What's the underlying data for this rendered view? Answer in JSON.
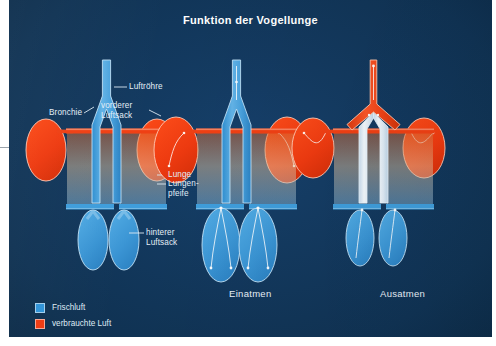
{
  "poster": {
    "title": "Funktion der Vogellunge",
    "background_color": "#12395f",
    "fresh_air_color": "#2f93d8",
    "used_air_color": "#f03a10",
    "lung_tube_top_color": "#ef3c12",
    "lung_tube_mid_color": "#f6dcc2",
    "lung_tube_bottom_color": "#3a9ada",
    "label_color": "#e3eef7"
  },
  "labels": {
    "trachea": "Luftröhre",
    "bronchus": "Bronchie",
    "front_air_sac": "vorderer\nLuftsack",
    "lung": "Lunge",
    "lung_pipe": "Lungen-\npfeife",
    "rear_air_sac": "hinterer\nLuftsack"
  },
  "panels": [
    {
      "id": "anatomy",
      "caption": ""
    },
    {
      "id": "inhale",
      "caption": "Einatmen"
    },
    {
      "id": "exhale",
      "caption": "Ausatmen"
    }
  ],
  "legend": {
    "items": [
      {
        "swatch": "fresh-air-swatch",
        "label": "Frischluft",
        "color": "#2f93d8"
      },
      {
        "swatch": "used-air-swatch",
        "label": "verbrauchte Luft",
        "color": "#f03a10"
      }
    ]
  }
}
